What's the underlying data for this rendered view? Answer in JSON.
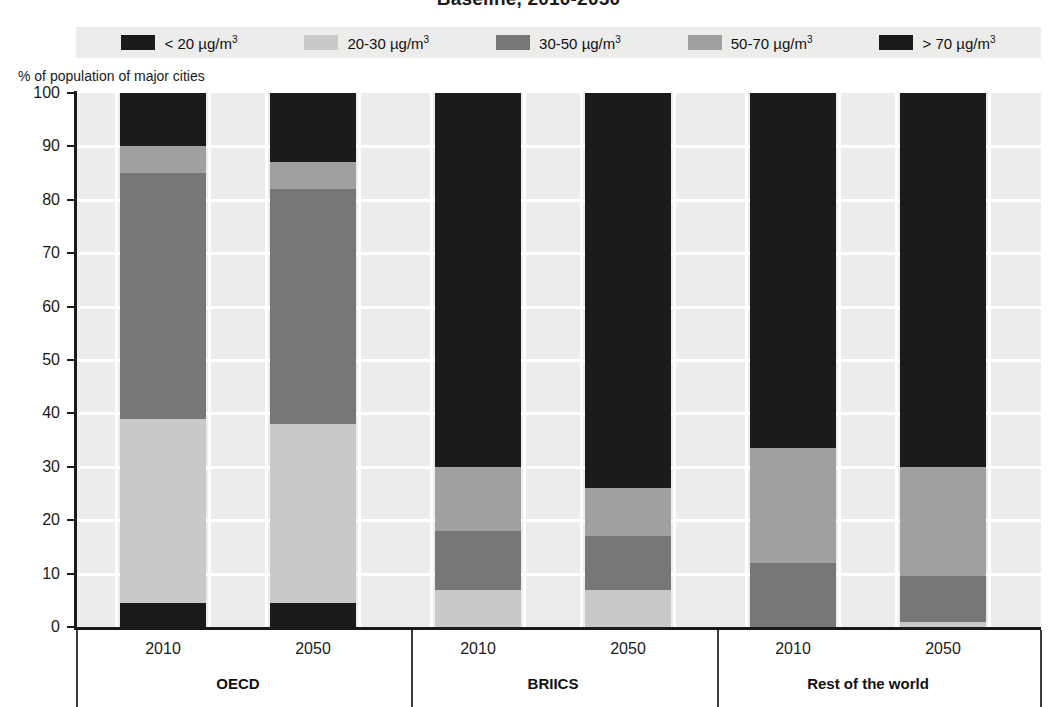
{
  "title": "Baseline, 2010-2050",
  "axis_caption": "% of population of major cities",
  "legend": {
    "items": [
      {
        "label": "< 20 µg/m",
        "sup": "3",
        "color": "#1b1b1b",
        "name": "lt-20"
      },
      {
        "label": "20-30 µg/m",
        "sup": "3",
        "color": "#c9c9c7",
        "name": "20-30"
      },
      {
        "label": "30-50 µg/m",
        "sup": "3",
        "color": "#777775",
        "name": "30-50"
      },
      {
        "label": "50-70 µg/m",
        "sup": "3",
        "color": "#a0a09e",
        "name": "50-70"
      },
      {
        "label": "> 70 µg/m",
        "sup": "3",
        "color": "#1b1b1b",
        "name": "gt-70"
      }
    ]
  },
  "y_axis": {
    "ticks": [
      "100",
      "90",
      "80",
      "70",
      "60",
      "50",
      "40",
      "30",
      "20",
      "10",
      "0"
    ],
    "min": 0,
    "max": 100
  },
  "groups": [
    {
      "label": "OECD",
      "years": [
        "2010",
        "2050"
      ]
    },
    {
      "label": "BRIICS",
      "years": [
        "2010",
        "2050"
      ]
    },
    {
      "label": "Rest of the world",
      "years": [
        "2010",
        "2050"
      ]
    }
  ],
  "chart_data": {
    "type": "bar",
    "subtype": "stacked-100",
    "title": "Baseline, 2010-2050",
    "xlabel": "",
    "ylabel": "% of population of major cities",
    "ylim": [
      0,
      100
    ],
    "grid": true,
    "legend_position": "top",
    "categories": [
      "OECD 2010",
      "OECD 2050",
      "BRIICS 2010",
      "BRIICS 2050",
      "Rest of the world 2010",
      "Rest of the world 2050"
    ],
    "series": [
      {
        "name": "< 20 µg/m3",
        "color": "#1b1b1b",
        "values": [
          4.5,
          4.5,
          0,
          0,
          0,
          0
        ]
      },
      {
        "name": "20-30 µg/m3",
        "color": "#c9c9c7",
        "values": [
          34.5,
          33.5,
          7.0,
          7.0,
          0,
          1.0
        ]
      },
      {
        "name": "30-50 µg/m3",
        "color": "#777775",
        "values": [
          46.0,
          44.0,
          11.0,
          10.0,
          12.0,
          8.5
        ]
      },
      {
        "name": "50-70 µg/m3",
        "color": "#a0a09e",
        "values": [
          5.0,
          5.0,
          12.0,
          9.0,
          21.5,
          20.5
        ]
      },
      {
        "name": "> 70 µg/m3",
        "color": "#1b1b1b",
        "values": [
          10.0,
          13.0,
          70.0,
          74.0,
          66.5,
          70.0
        ]
      }
    ],
    "stack_boundaries": {
      "OECD 2010": [
        0,
        4.5,
        39,
        85,
        90,
        100
      ],
      "OECD 2050": [
        0,
        4.5,
        38,
        82,
        87,
        100
      ],
      "BRIICS 2010": [
        0,
        0,
        7,
        18,
        30,
        100
      ],
      "BRIICS 2050": [
        0,
        0,
        7,
        17,
        26,
        100
      ],
      "Rest of the world 2010": [
        0,
        0,
        0,
        12,
        33.5,
        100
      ],
      "Rest of the world 2050": [
        0,
        0,
        1,
        9.5,
        30,
        100
      ]
    }
  },
  "layout": {
    "bar_left_px": [
      120,
      270,
      435,
      585,
      750,
      900
    ],
    "bar_width_px": 86,
    "plot_left_px": 76,
    "plot_top_px": 93,
    "plot_width_px": 965,
    "plot_height_px": 534
  },
  "colors": {
    "plot_bg": "#ececeb",
    "grid": "#ffffff",
    "axis": "#1a1a1a",
    "text": "#1a1a1a"
  }
}
